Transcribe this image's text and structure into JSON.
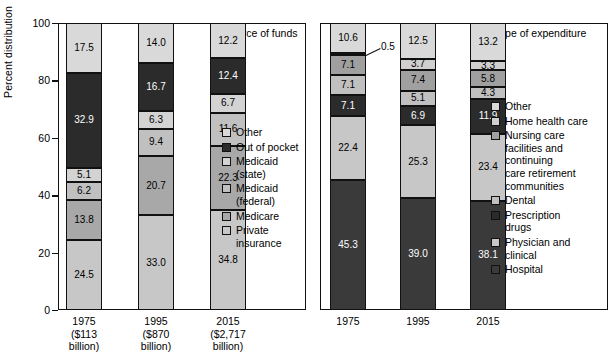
{
  "chart_data": [
    {
      "type": "bar",
      "title": "Source of funds",
      "stacked": true,
      "ylabel": "Percent distribution",
      "xlabel": "",
      "ylim": [
        0,
        100
      ],
      "yticks": [
        "0",
        "20",
        "40",
        "60",
        "80",
        "100"
      ],
      "grid": false,
      "legend_position": "right",
      "categories": [
        "1975",
        "1995",
        "2015"
      ],
      "category_sublabels": [
        [
          "($113",
          "billion)"
        ],
        [
          "($870",
          "billion)"
        ],
        [
          "($2,717",
          "billion)"
        ]
      ],
      "series": [
        {
          "name": "Private insurance",
          "color": "#c7c7c7",
          "values": [
            24.5,
            33.0,
            34.8
          ]
        },
        {
          "name": "Medicare",
          "color": "#a8a8a8",
          "values": [
            13.8,
            20.7,
            22.3
          ]
        },
        {
          "name": "Medicaid (federal)",
          "color": "#c0c0c0",
          "values": [
            6.2,
            9.4,
            11.6
          ]
        },
        {
          "name": "Medicaid (state)",
          "color": "#d3d3d3",
          "values": [
            5.1,
            6.3,
            6.7
          ]
        },
        {
          "name": "Out of pocket",
          "color": "#2b2b2b",
          "values": [
            32.9,
            16.7,
            12.4
          ]
        },
        {
          "name": "Other",
          "color": "#d9d9d9",
          "values": [
            17.5,
            14.0,
            12.2
          ]
        }
      ],
      "legend": [
        {
          "label": "Other",
          "color": "#d9d9d9"
        },
        {
          "label": "Out of pocket",
          "color": "#2b2b2b"
        },
        {
          "label": "Medicaid\n(state)",
          "color": "#d3d3d3"
        },
        {
          "label": "Medicaid\n(federal)",
          "color": "#c0c0c0"
        },
        {
          "label": "Medicare",
          "color": "#a8a8a8"
        },
        {
          "label": "Private\ninsurance",
          "color": "#c7c7c7"
        }
      ]
    },
    {
      "type": "bar",
      "title": "Type of expenditure",
      "stacked": true,
      "ylabel": "",
      "xlabel": "",
      "ylim": [
        0,
        100
      ],
      "grid": false,
      "legend_position": "right",
      "categories": [
        "1975",
        "1995",
        "2015"
      ],
      "series": [
        {
          "name": "Hospital",
          "color": "#3a3a3a",
          "values": [
            45.3,
            39.0,
            38.1
          ]
        },
        {
          "name": "Physician and clinical",
          "color": "#c7c7c7",
          "values": [
            22.4,
            25.3,
            23.4
          ]
        },
        {
          "name": "Prescription drugs",
          "color": "#2b2b2b",
          "values": [
            7.1,
            6.9,
            11.9
          ]
        },
        {
          "name": "Dental",
          "color": "#c0c0c0",
          "values": [
            7.1,
            5.1,
            4.3
          ]
        },
        {
          "name": "Nursing care facilities and continuing care retirement communities",
          "color": "#a0a0a0",
          "values": [
            7.1,
            7.4,
            5.8
          ]
        },
        {
          "name": "Home health care",
          "color": "#cfcfcf",
          "values": [
            0.5,
            3.7,
            3.3
          ]
        },
        {
          "name": "Other",
          "color": "#d9d9d9",
          "values": [
            10.6,
            12.5,
            13.2
          ]
        }
      ],
      "annotations": [
        {
          "text": "0.5",
          "series": "Home health care",
          "category": "1975"
        }
      ],
      "legend": [
        {
          "label": "Other",
          "color": "#d9d9d9"
        },
        {
          "label": "Home health care",
          "color": "#cfcfcf"
        },
        {
          "label": "Nursing care\nfacilities and\ncontinuing\ncare retirement\ncommunities",
          "color": "#a0a0a0"
        },
        {
          "label": "Dental",
          "color": "#c0c0c0"
        },
        {
          "label": "Prescription\ndrugs",
          "color": "#2b2b2b"
        },
        {
          "label": "Physician and\nclinical",
          "color": "#c7c7c7"
        },
        {
          "label": "Hospital",
          "color": "#3a3a3a"
        }
      ]
    }
  ]
}
